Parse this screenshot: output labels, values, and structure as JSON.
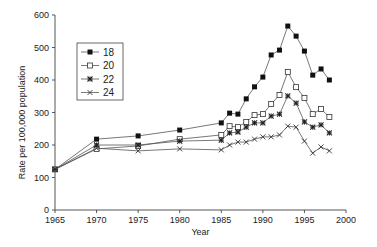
{
  "chart_data": {
    "type": "line",
    "title": "",
    "xlabel": "Year",
    "ylabel": "Rate per 100,000 population",
    "xlim": [
      1965,
      2000
    ],
    "ylim": [
      0,
      600
    ],
    "xticks": [
      1965,
      1970,
      1975,
      1980,
      1985,
      1990,
      1995,
      2000
    ],
    "yticks": [
      0,
      100,
      200,
      300,
      400,
      500,
      600
    ],
    "grid": false,
    "legend_position": "upper-left-inset",
    "x": [
      1965,
      1970,
      1975,
      1980,
      1985,
      1986,
      1987,
      1988,
      1989,
      1990,
      1991,
      1992,
      1993,
      1994,
      1995,
      1996,
      1997,
      1998
    ],
    "series": [
      {
        "name": "18",
        "marker": "filled-square",
        "values": [
          125,
          218,
          228,
          246,
          268,
          298,
          295,
          342,
          379,
          409,
          477,
          492,
          566,
          535,
          489,
          415,
          434,
          400
        ]
      },
      {
        "name": "20",
        "marker": "open-square",
        "values": [
          125,
          188,
          197,
          218,
          231,
          258,
          255,
          271,
          292,
          295,
          326,
          354,
          425,
          378,
          345,
          295,
          311,
          286
        ]
      },
      {
        "name": "22",
        "marker": "asterisk",
        "values": [
          125,
          200,
          200,
          212,
          215,
          237,
          240,
          255,
          268,
          268,
          289,
          295,
          351,
          329,
          271,
          255,
          262,
          237
        ]
      },
      {
        "name": "24",
        "marker": "cross",
        "values": [
          125,
          190,
          182,
          188,
          185,
          200,
          209,
          209,
          218,
          225,
          225,
          231,
          258,
          255,
          212,
          175,
          194,
          182
        ]
      }
    ]
  }
}
